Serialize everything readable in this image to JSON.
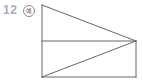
{
  "problem": {
    "number": "12",
    "badge_label": "예"
  },
  "figure": {
    "type": "geometric-diagram",
    "stroke_color": "#666666",
    "vertices": {
      "top_left": [
        42,
        5
      ],
      "bottom_left": [
        42,
        77
      ],
      "bottom_right": [
        136,
        77
      ],
      "right_mid": [
        136,
        41
      ],
      "left_mid": [
        42,
        41
      ]
    },
    "segments": [
      {
        "name": "left-edge",
        "from": "top_left",
        "to": "bottom_left"
      },
      {
        "name": "top-slant-edge",
        "from": "top_left",
        "to": "right_mid"
      },
      {
        "name": "right-edge",
        "from": "right_mid",
        "to": "bottom_right"
      },
      {
        "name": "bottom-edge",
        "from": "bottom_left",
        "to": "bottom_right"
      },
      {
        "name": "horizontal-midline",
        "from": "left_mid",
        "to": "right_mid"
      },
      {
        "name": "lower-diagonal",
        "from": "bottom_left",
        "to": "right_mid"
      }
    ]
  }
}
